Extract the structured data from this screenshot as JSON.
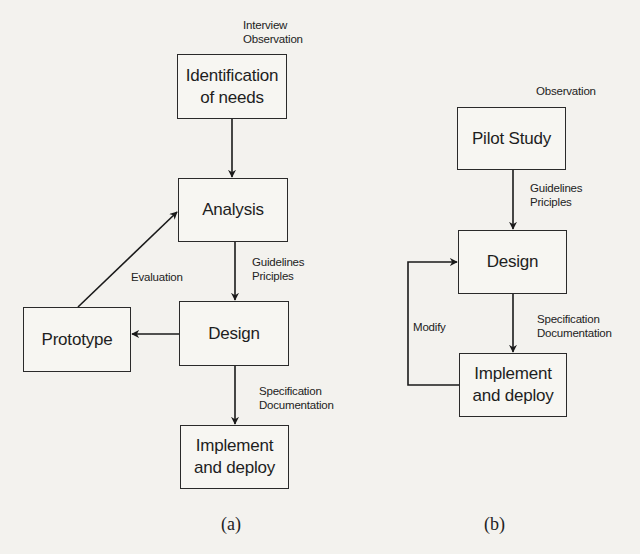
{
  "diagram_a": {
    "caption": "(a)",
    "nodes": {
      "identification": {
        "line1": "Identification",
        "line2": "of needs"
      },
      "analysis": {
        "label": "Analysis"
      },
      "design": {
        "label": "Design"
      },
      "prototype": {
        "label": "Prototype"
      },
      "implement": {
        "line1": "Implement",
        "line2": "and deploy"
      }
    },
    "annotations": {
      "input": {
        "line1": "Interview",
        "line2": "Observation"
      },
      "analysis_to_design": {
        "line1": "Guidelines",
        "line2": "Priciples"
      },
      "design_to_implement": {
        "line1": "Specification",
        "line2": "Documentation"
      },
      "prototype_to_analysis": {
        "label": "Evaluation"
      }
    }
  },
  "diagram_b": {
    "caption": "(b)",
    "nodes": {
      "pilot": {
        "label": "Pilot Study"
      },
      "design": {
        "label": "Design"
      },
      "implement": {
        "line1": "Implement",
        "line2": "and deploy"
      }
    },
    "annotations": {
      "input": {
        "label": "Observation"
      },
      "pilot_to_design": {
        "line1": "Guidelines",
        "line2": "Priciples"
      },
      "design_to_implement": {
        "line1": "Specification",
        "line2": "Documentation"
      },
      "loop": {
        "label": "Modify"
      }
    }
  }
}
